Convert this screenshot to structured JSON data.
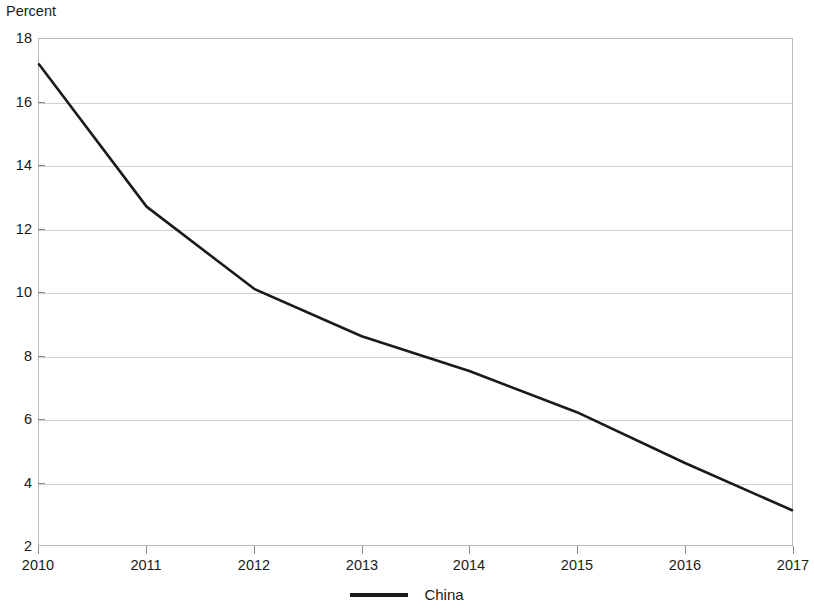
{
  "chart_data": {
    "type": "line",
    "title": "",
    "subtitle": "",
    "xlabel": "",
    "ylabel": "Percent",
    "x": [
      2010,
      2011,
      2012,
      2013,
      2014,
      2015,
      2016,
      2017
    ],
    "xtick_labels": [
      "2010",
      "2011",
      "2012",
      "2013",
      "2014",
      "2015",
      "2016",
      "2017"
    ],
    "xlim": [
      2010,
      2017
    ],
    "ytick_labels": [
      "18",
      "16",
      "14",
      "12",
      "10",
      "8",
      "6",
      "4",
      "2"
    ],
    "yticks": [
      18,
      16,
      14,
      12,
      10,
      8,
      6,
      4,
      2
    ],
    "ylim": [
      2,
      18
    ],
    "grid": "horizontal",
    "legend_position": "bottom-center",
    "series": [
      {
        "name": "China",
        "color": "#1a1a1a",
        "values": [
          17.2,
          12.7,
          10.1,
          8.6,
          7.5,
          6.2,
          4.6,
          3.1
        ]
      }
    ]
  },
  "legend": {
    "items": [
      {
        "label": "China",
        "swatch": "line-swatch"
      }
    ]
  }
}
